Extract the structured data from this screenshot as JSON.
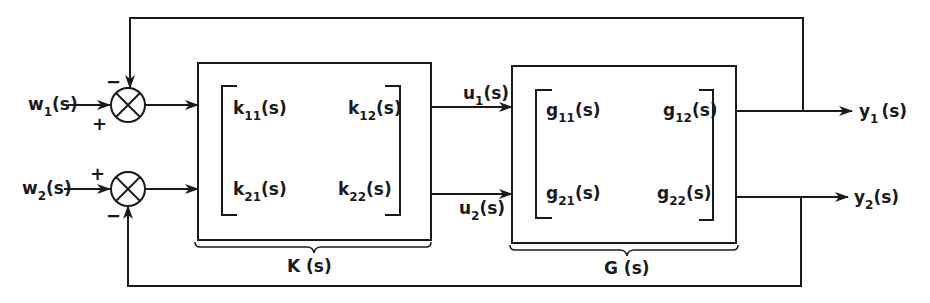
{
  "diagram": {
    "type": "block-diagram",
    "inputs": [
      {
        "label": "w",
        "sub": "1",
        "arg": "(s)"
      },
      {
        "label": "w",
        "sub": "2",
        "arg": "(s)"
      }
    ],
    "summers": [
      {
        "top_sign": "−",
        "bottom_sign": "+"
      },
      {
        "top_sign": "+",
        "bottom_sign": "−"
      }
    ],
    "controller": {
      "name": "K (s)",
      "entries": [
        {
          "label": "k",
          "sub": "11",
          "arg": "(s)"
        },
        {
          "label": "k",
          "sub": "12",
          "arg": "(s)"
        },
        {
          "label": "k",
          "sub": "21",
          "arg": "(s)"
        },
        {
          "label": "k",
          "sub": "22",
          "arg": "(s)"
        }
      ]
    },
    "control_signals": [
      {
        "label": "u",
        "sub": "1",
        "arg": "(s)"
      },
      {
        "label": "u",
        "sub": "2",
        "arg": "(s)"
      }
    ],
    "plant": {
      "name": "G (s)",
      "entries": [
        {
          "label": "g",
          "sub": "11",
          "arg": "(s)"
        },
        {
          "label": "g",
          "sub": "12",
          "arg": "(s)"
        },
        {
          "label": "g",
          "sub": "21",
          "arg": "(s)"
        },
        {
          "label": "g",
          "sub": "22",
          "arg": "(s)"
        }
      ]
    },
    "outputs": [
      {
        "label": "y",
        "sub": "1",
        "arg": "(s)"
      },
      {
        "label": "y",
        "sub": "2",
        "arg": "(s)"
      }
    ]
  }
}
